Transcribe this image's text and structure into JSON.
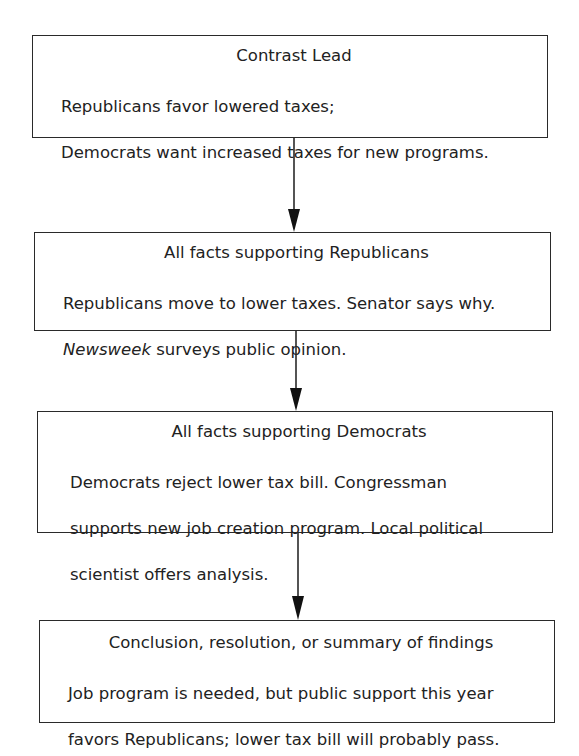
{
  "diagram": {
    "type": "flowchart",
    "direction": "top-to-bottom",
    "boxes": [
      {
        "title": "Contrast Lead",
        "body_lines": [
          "Republicans favor lowered taxes;",
          "Democrats want increased taxes for new programs."
        ]
      },
      {
        "title": "All facts supporting Republicans",
        "body_lines": [
          "Republicans move to lower taxes. Senator says why.",
          "surveys public opinion."
        ],
        "italic_prefix": "Newsweek"
      },
      {
        "title": "All facts supporting Democrats",
        "body_lines": [
          "Democrats reject lower tax bill. Congressman",
          "supports new job creation program. Local political",
          "scientist offers analysis."
        ]
      },
      {
        "title": "Conclusion, resolution, or summary of findings",
        "body_lines": [
          "Job program is needed, but public support this year",
          "favors Republicans; lower tax bill will probably pass."
        ]
      }
    ],
    "edges": [
      {
        "from": 0,
        "to": 1
      },
      {
        "from": 1,
        "to": 2
      },
      {
        "from": 2,
        "to": 3
      }
    ],
    "colors": {
      "stroke": "#2a2a2a",
      "text": "#222222",
      "background": "#ffffff"
    }
  }
}
